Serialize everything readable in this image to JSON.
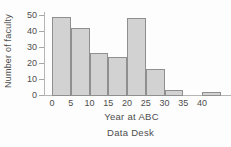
{
  "chart_data": {
    "type": "bar",
    "subtype": "histogram",
    "title": "",
    "xlabel": "Year at ABC",
    "ylabel": "Number of faculty",
    "bin_width": 5,
    "bin_edges": [
      0,
      5,
      10,
      15,
      20,
      25,
      30,
      35,
      40,
      45
    ],
    "values": [
      49,
      42,
      26,
      24,
      48,
      16,
      3,
      0,
      2
    ],
    "x_ticks": [
      0,
      5,
      10,
      15,
      20,
      25,
      30,
      35,
      40
    ],
    "y_ticks": [
      0,
      10,
      20,
      30,
      40,
      50
    ],
    "xlim": [
      0,
      45
    ],
    "ylim": [
      0,
      50
    ],
    "grid": false,
    "legend": "none"
  },
  "caption": {
    "text": "Data Desk"
  },
  "colors": {
    "bar_fill": "#d2d2d2",
    "bar_border": "#8f8f8f",
    "axis": "#b5b5b5",
    "tick": "#a8a8a8",
    "text": "#4d4d4d",
    "background": "#fdfdfd"
  }
}
